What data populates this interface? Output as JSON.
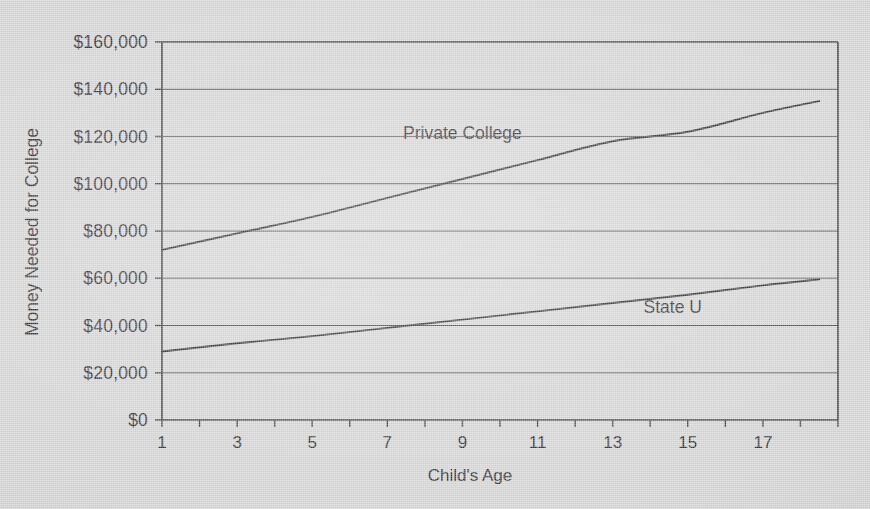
{
  "chart_data": {
    "type": "line",
    "title": "",
    "xlabel": "Child's Age",
    "ylabel": "Money Needed for College",
    "xlim": [
      1,
      19
    ],
    "ylim": [
      0,
      160000
    ],
    "grid": true,
    "legend_position": "inline-annotation",
    "x_ticks": [
      1,
      3,
      5,
      7,
      9,
      11,
      13,
      15,
      17
    ],
    "x_tick_labels": [
      "1",
      "3",
      "5",
      "7",
      "9",
      "11",
      "13",
      "15",
      "17"
    ],
    "y_ticks": [
      0,
      20000,
      40000,
      60000,
      80000,
      100000,
      120000,
      140000,
      160000
    ],
    "y_tick_labels": [
      "$0",
      "$20,000",
      "$40,000",
      "$60,000",
      "$80,000",
      "$100,000",
      "$120,000",
      "$140,000",
      "$160,000"
    ],
    "x": [
      1,
      3,
      5,
      7,
      9,
      11,
      13,
      15,
      17,
      18.5
    ],
    "series": [
      {
        "name": "Private College",
        "label": "Private College",
        "color": "#2e2e2e",
        "values": [
          72000,
          79000,
          86000,
          94000,
          102000,
          110000,
          118000,
          122000,
          130000,
          135000
        ]
      },
      {
        "name": "State U",
        "label": "State U",
        "color": "#2e2e2e",
        "values": [
          29000,
          32500,
          35500,
          39000,
          42500,
          46000,
          49500,
          53000,
          57000,
          59500
        ]
      }
    ],
    "annotations": [
      {
        "text": "Private College",
        "x": 9.0,
        "y": 119000
      },
      {
        "text": "State U",
        "x": 14.6,
        "y": 45500
      }
    ]
  },
  "colors": {
    "background": "#d5d5d5",
    "axis": "#3a3a3a",
    "grid": "#4a4a4a",
    "text": "#2c2c2c",
    "line": "#2e2e2e"
  }
}
